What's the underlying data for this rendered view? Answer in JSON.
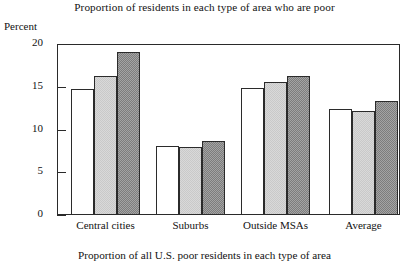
{
  "chart_data": {
    "type": "bar",
    "title": "Proportion of residents in each type of area who are poor",
    "caption": "Proportion of all U.S. poor residents in each type of area",
    "xlabel": "",
    "ylabel": "Percent",
    "ylim": [
      0,
      20
    ],
    "yticks": [
      0,
      5,
      10,
      15,
      20
    ],
    "ytick_labels": [
      "0",
      "5",
      "10",
      "15",
      "20"
    ],
    "grid": false,
    "legend": "none",
    "categories": [
      "Central cities",
      "Suburbs",
      "Outside MSAs",
      "Average"
    ],
    "series": [
      {
        "name": "series-1",
        "fill": "white",
        "values": [
          14.7,
          8.1,
          14.9,
          12.4
        ]
      },
      {
        "name": "series-2",
        "fill": "light-gray",
        "values": [
          16.3,
          7.9,
          15.6,
          12.2
        ]
      },
      {
        "name": "series-3",
        "fill": "dark-gray",
        "values": [
          19.1,
          8.7,
          16.3,
          13.3
        ]
      }
    ],
    "colors": {
      "series_1_fill": "#ffffff",
      "series_2_fill": "#c9c9c9",
      "series_3_fill": "#7d7d7d",
      "bar_outline": "#2b2b2b",
      "axis": "#2a2a2a",
      "text": "#121212",
      "background": "#ffffff"
    }
  }
}
